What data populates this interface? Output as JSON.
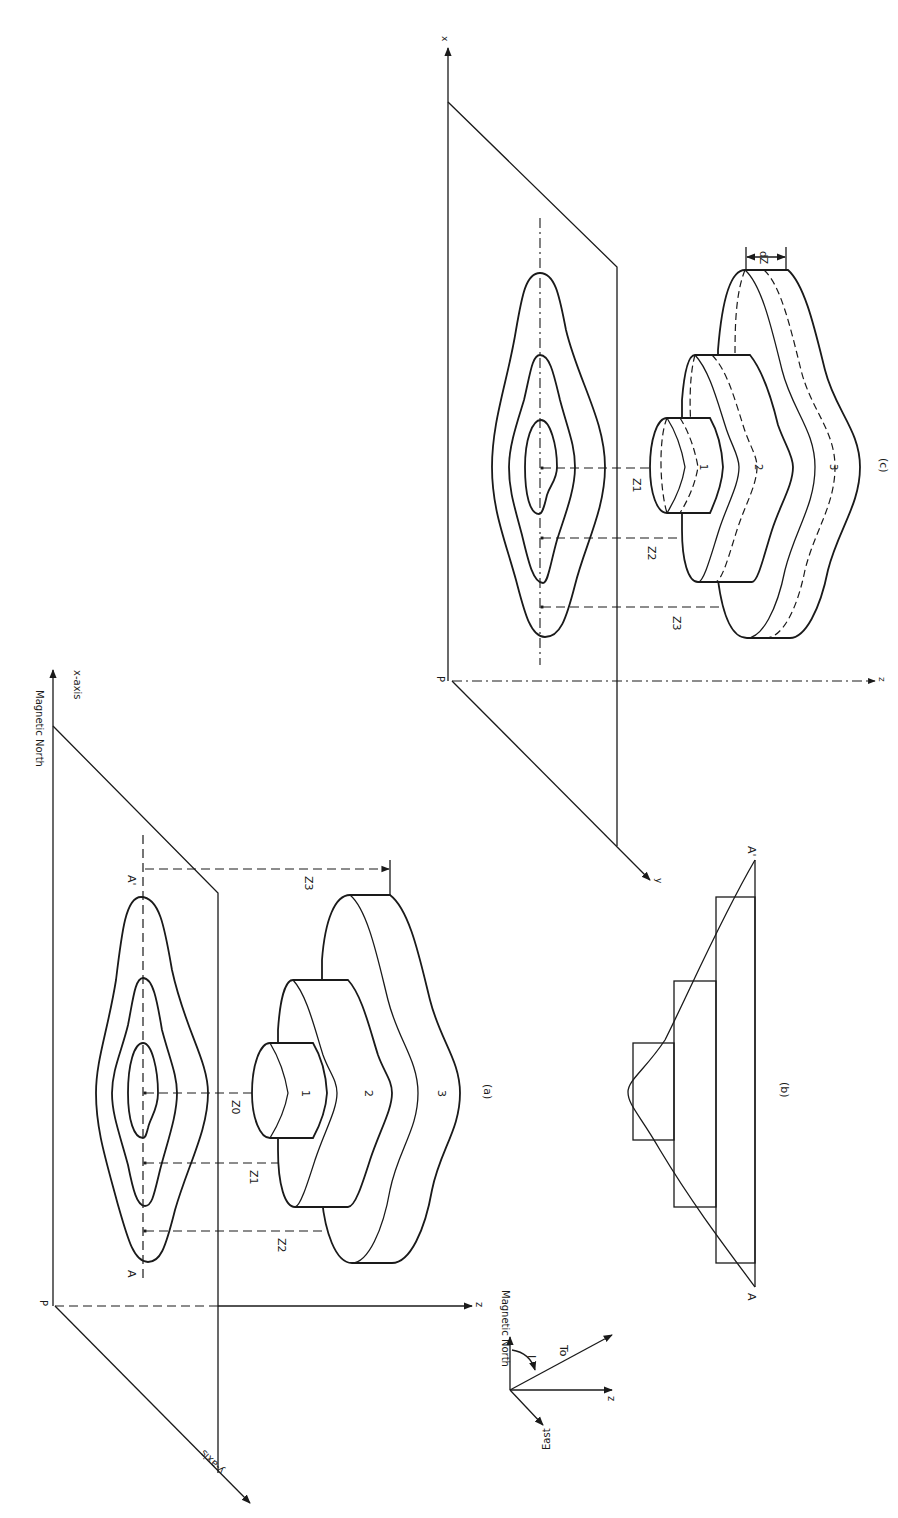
{
  "figure": {
    "panels": {
      "a": {
        "caption": "(a)",
        "origin_label": "P",
        "x_axis_label": "x-axis",
        "north_label": "Magnetic North",
        "y_axis_label": "y-axis",
        "z_axis_label": "z",
        "section_start": "A",
        "section_end": "A'",
        "depth_labels": [
          "Z0",
          "Z1",
          "Z2",
          "Z3"
        ],
        "body_labels": [
          "1",
          "2",
          "3"
        ]
      },
      "b": {
        "caption": "(b)",
        "section_start": "A",
        "section_end": "A'"
      },
      "c": {
        "caption": "(c)",
        "origin_label": "P",
        "x_axis_label": "x",
        "y_axis_label": "y",
        "z_axis_label": "z",
        "depth_labels": [
          "Z1",
          "Z2",
          "Z3"
        ],
        "body_labels": [
          "1",
          "2",
          "3"
        ],
        "thickness_label": "dZ"
      }
    },
    "legend": {
      "north_label": "Magnetic North",
      "east_label": "East",
      "z_label": "z",
      "field_label": "To",
      "inclination_label": "I"
    },
    "colors": {
      "ink": "#1a1a1a",
      "paper": "#ffffff"
    }
  }
}
